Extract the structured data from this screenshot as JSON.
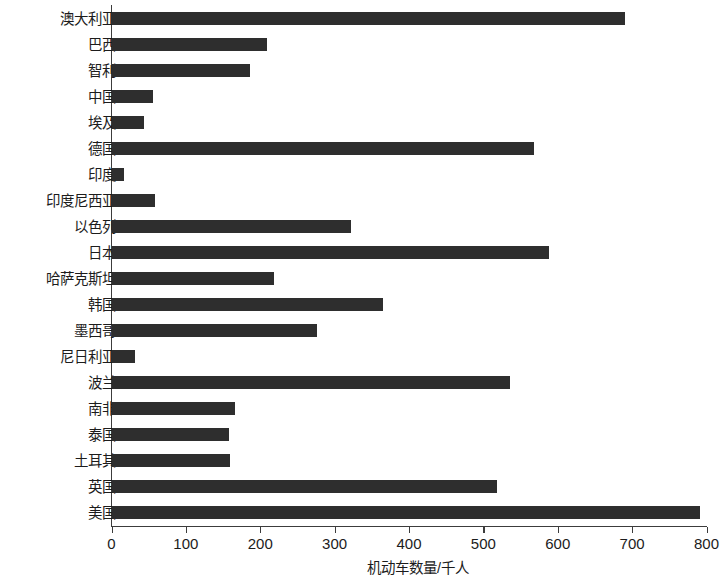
{
  "chart_data": {
    "type": "bar",
    "orientation": "horizontal",
    "title": "",
    "xlabel": "机动车数量/千人",
    "ylabel": "",
    "xlim": [
      0,
      800
    ],
    "xticks": [
      0,
      100,
      200,
      300,
      400,
      500,
      600,
      700,
      800
    ],
    "grid": false,
    "legend": null,
    "bar_color": "#2e2e2e",
    "axis_color": "#3c3c3c",
    "categories": [
      "澳大利亚",
      "巴西",
      "智利",
      "中国",
      "埃及",
      "德国",
      "印度",
      "印度尼西亚",
      "以色列",
      "日本",
      "哈萨克斯坦",
      "韩国",
      "墨西哥",
      "尼日利亚",
      "波兰",
      "南非",
      "泰国",
      "土耳其",
      "英国",
      "美国"
    ],
    "values": [
      690,
      208,
      185,
      55,
      43,
      568,
      16,
      58,
      322,
      588,
      218,
      364,
      276,
      31,
      535,
      166,
      157,
      159,
      517,
      790
    ]
  }
}
